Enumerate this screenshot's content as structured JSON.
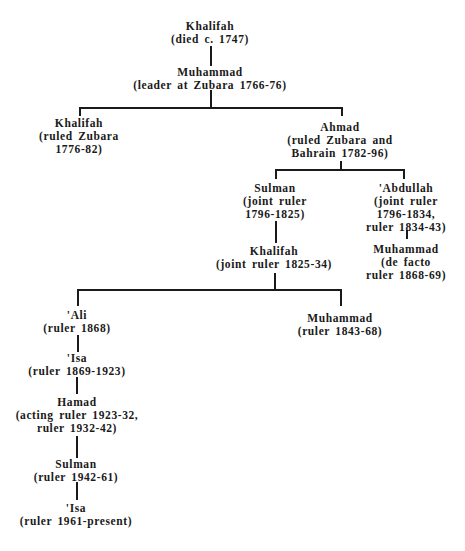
{
  "diagram": {
    "type": "family-tree",
    "nodes": [
      {
        "id": "khalifah_1",
        "name": "Khalifah",
        "desc": [
          "(died c. 1747)"
        ]
      },
      {
        "id": "muhammad_1",
        "name": "Muhammad",
        "desc": [
          "(leader at Zubara 1766-76)"
        ]
      },
      {
        "id": "khalifah_2",
        "name": "Khalifah",
        "desc": [
          "(ruled Zubara",
          "1776-82)"
        ]
      },
      {
        "id": "ahmad",
        "name": "Ahmad",
        "desc": [
          "(ruled Zubara and",
          "Bahrain 1782-96)"
        ]
      },
      {
        "id": "sulman_1",
        "name": "Sulman",
        "desc": [
          "(joint ruler",
          "1796-1825)"
        ]
      },
      {
        "id": "abdullah",
        "name": "'Abdullah",
        "desc": [
          "(joint ruler",
          "1796-1834,",
          "ruler 1834-43)"
        ]
      },
      {
        "id": "khalifah_3",
        "name": "Khalifah",
        "desc": [
          "(joint ruler 1825-34)"
        ]
      },
      {
        "id": "muhammad_2",
        "name": "Muhammad",
        "desc": [
          "(de facto",
          "ruler 1868-69)"
        ]
      },
      {
        "id": "ali",
        "name": "'Ali",
        "desc": [
          "(ruler 1868)"
        ]
      },
      {
        "id": "muhammad_3",
        "name": "Muhammad",
        "desc": [
          "(ruler 1843-68)"
        ]
      },
      {
        "id": "isa_1",
        "name": "'Isa",
        "desc": [
          "(ruler 1869-1923)"
        ]
      },
      {
        "id": "hamad",
        "name": "Hamad",
        "desc": [
          "(acting ruler 1923-32,",
          "ruler 1932-42)"
        ]
      },
      {
        "id": "sulman_2",
        "name": "Sulman",
        "desc": [
          "(ruler 1942-61)"
        ]
      },
      {
        "id": "isa_2",
        "name": "'Isa",
        "desc": [
          "(ruler 1961-present)"
        ]
      }
    ],
    "edges": [
      [
        "khalifah_1",
        "muhammad_1"
      ],
      [
        "muhammad_1",
        "khalifah_2"
      ],
      [
        "muhammad_1",
        "ahmad"
      ],
      [
        "ahmad",
        "sulman_1"
      ],
      [
        "ahmad",
        "abdullah"
      ],
      [
        "sulman_1",
        "khalifah_3"
      ],
      [
        "abdullah",
        "muhammad_2"
      ],
      [
        "khalifah_3",
        "ali"
      ],
      [
        "khalifah_3",
        "muhammad_3"
      ],
      [
        "ali",
        "isa_1"
      ],
      [
        "isa_1",
        "hamad"
      ],
      [
        "hamad",
        "sulman_2"
      ],
      [
        "sulman_2",
        "isa_2"
      ]
    ]
  }
}
